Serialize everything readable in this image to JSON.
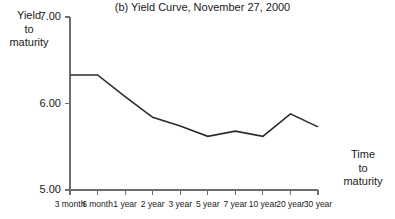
{
  "chart_data": {
    "type": "line",
    "title": "(b) Yield Curve, November 27, 2000",
    "xlabel": "Time to maturity",
    "ylabel": "Yield to maturity",
    "categories": [
      "3 month",
      "6 month",
      "1 year",
      "2 year",
      "3 year",
      "5 year",
      "7 year",
      "10 year",
      "20 year",
      "30 year"
    ],
    "values": [
      6.33,
      6.33,
      6.08,
      5.84,
      5.74,
      5.62,
      5.68,
      5.62,
      5.88,
      5.73
    ],
    "series": [
      {
        "name": "Yield curve",
        "values": [
          6.33,
          6.33,
          6.08,
          5.84,
          5.74,
          5.62,
          5.68,
          5.62,
          5.88,
          5.73
        ]
      }
    ],
    "ylim": [
      5.0,
      7.0
    ],
    "ytick_labels": [
      "7.00",
      "6.00",
      "5.00"
    ],
    "ytick_values": [
      7.0,
      6.0,
      5.0
    ],
    "grid": false,
    "legend": "none",
    "line_color": "#2b2b2b",
    "axis_color": "#6d6d6d"
  },
  "axis_labels": {
    "y_line1": "Yield",
    "y_line2": "to",
    "y_line3": "maturity",
    "x_line1": "Time",
    "x_line2": "to",
    "x_line3": "maturity"
  }
}
